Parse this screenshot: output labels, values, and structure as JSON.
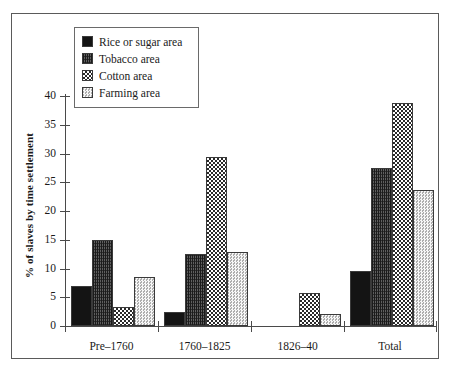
{
  "chart_data": {
    "type": "bar",
    "title": "",
    "subtitle": "",
    "xlabel": "",
    "ylabel": "% of slaves by time settlement",
    "categories": [
      "Pre–1760",
      "1760–1825",
      "1826–40",
      "Total"
    ],
    "series": [
      {
        "name": "Rice or sugar area",
        "values": [
          7.0,
          2.5,
          0,
          9.5
        ],
        "pattern": "solid-black",
        "color": "#141414"
      },
      {
        "name": "Tobacco area",
        "values": [
          15.0,
          12.5,
          0,
          27.4
        ],
        "pattern": "dense-vertical-stripe",
        "color": "#5f5f5f"
      },
      {
        "name": "Cotton area",
        "values": [
          3.3,
          29.4,
          5.8,
          38.7
        ],
        "pattern": "checkerboard",
        "color": "#2a2a2a"
      },
      {
        "name": "Farming area",
        "values": [
          8.5,
          12.9,
          2.1,
          23.7
        ],
        "pattern": "light-dotted",
        "color": "#c9c9c9"
      }
    ],
    "ylim": [
      0,
      40
    ],
    "yticks": [
      0,
      5,
      10,
      15,
      20,
      25,
      30,
      35,
      40
    ],
    "ytick_labels": [
      "0",
      "5",
      "10",
      "15",
      "20",
      "25",
      "30",
      "35",
      "40"
    ],
    "grid": false,
    "legend_position": "upper-left-inside"
  },
  "legend": {
    "items": [
      {
        "label": "Rice or sugar area"
      },
      {
        "label": "Tobacco area"
      },
      {
        "label": "Cotton area"
      },
      {
        "label": "Farming area"
      }
    ]
  },
  "axes": {
    "y_title": "% of slaves by time settlement",
    "y_labels": [
      "40",
      "35",
      "30",
      "25",
      "20",
      "15",
      "10",
      "5",
      "0"
    ],
    "x_labels": [
      "Pre–1760",
      "1760–1825",
      "1826–40",
      "Total"
    ]
  }
}
